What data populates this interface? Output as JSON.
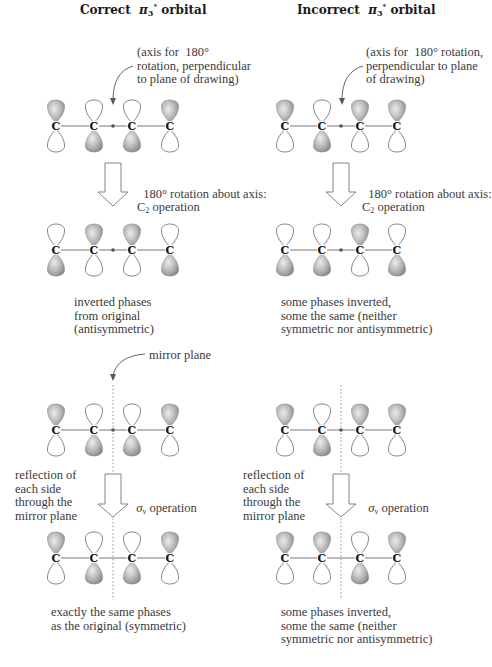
{
  "columns": [
    {
      "title_prefix": "Correct",
      "title_symbol": "π",
      "title_sub": "3",
      "title_sup": "*",
      "title_suffix": "orbital",
      "axis_note": "(axis for  180°\nrotation, perpendicular\nto plane of drawing)",
      "rotation_note": "180° rotation about axis:",
      "rotation_op": "C",
      "rotation_op_sub": "2",
      "rotation_op_suffix": " operation",
      "rotation_result": "inverted phases\nfrom original\n(antisymmetric)",
      "mirror_note": "mirror plane",
      "reflection_note": "reflection of\neach side\nthrough the\nmirror plane",
      "sigma_symbol": "σ",
      "sigma_sub": "v",
      "sigma_suffix": " operation",
      "reflection_result": "exactly the same phases\nas the original (symmetric)",
      "rows": [
        {
          "name": "original",
          "top_shaded": [
            1,
            0,
            0,
            1
          ]
        },
        {
          "name": "after-c2",
          "top_shaded": [
            0,
            1,
            1,
            0
          ]
        },
        {
          "name": "mirror-original",
          "top_shaded": [
            1,
            0,
            0,
            1
          ]
        },
        {
          "name": "after-sigma-v",
          "top_shaded": [
            1,
            0,
            0,
            1
          ]
        }
      ]
    },
    {
      "title_prefix": "Incorrect",
      "title_symbol": "π",
      "title_sub": "3",
      "title_sup": "*",
      "title_suffix": "orbital",
      "axis_note": "(axis for  180° rotation,\nperpendicular to plane\nof drawing)",
      "rotation_note": "180° rotation about axis:",
      "rotation_op": "C",
      "rotation_op_sub": "2",
      "rotation_op_suffix": " operation",
      "rotation_result": "some phases inverted,\nsome the same (neither\nsymmetric nor antisymmetric)",
      "reflection_note": "reflection of\neach side\nthrough the\nmirror plane",
      "sigma_symbol": "σ",
      "sigma_sub": "v",
      "sigma_suffix": " operation",
      "reflection_result": "some phases inverted,\nsome the same (neither\nsymmetric nor antisymmetric)",
      "rows": [
        {
          "name": "original",
          "top_shaded": [
            1,
            0,
            1,
            1
          ]
        },
        {
          "name": "after-c2",
          "top_shaded": [
            0,
            0,
            1,
            0
          ]
        },
        {
          "name": "mirror-original",
          "top_shaded": [
            1,
            0,
            1,
            1
          ]
        },
        {
          "name": "after-sigma-v",
          "top_shaded": [
            1,
            1,
            0,
            1
          ]
        }
      ]
    }
  ],
  "atom_label": "C",
  "colors": {
    "shaded_lobe_light": "#e6e6e6",
    "shaded_lobe_dark": "#8a8a8a",
    "outline": "#555555",
    "text": "#3a3a3a"
  }
}
